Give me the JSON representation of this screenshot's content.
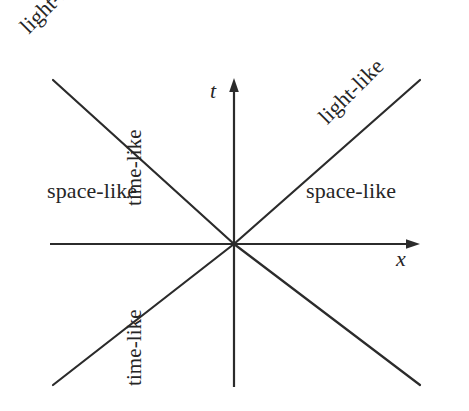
{
  "figure": {
    "kind": "minkowski-light-cone-diagram",
    "background_color": "#ffffff",
    "ink_color": "#262626"
  },
  "axes": {
    "vertical": {
      "name": "t",
      "arrow": "arrow-up",
      "x": 234,
      "y_top": 78,
      "y_bottom": 387
    },
    "horizontal": {
      "name": "x",
      "arrow": "arrow-right",
      "y": 244,
      "x_left": 50,
      "x_right": 420
    },
    "origin": {
      "x": 234,
      "y": 244
    }
  },
  "lightcone": {
    "lines": [
      {
        "name": "upper-left-null-ray",
        "x1": 234,
        "y1": 244,
        "x2": 53,
        "y2": 80
      },
      {
        "name": "upper-right-null-ray",
        "x1": 234,
        "y1": 244,
        "x2": 420,
        "y2": 80
      },
      {
        "name": "lower-left-null-ray",
        "x1": 234,
        "y1": 244,
        "x2": 53,
        "y2": 385
      },
      {
        "name": "lower-right-null-ray",
        "x1": 234,
        "y1": 244,
        "x2": 420,
        "y2": 385
      }
    ]
  },
  "labels": {
    "light_like_top_left": "light-like",
    "light_like_top_right": "light-like",
    "space_like_left": "space-like",
    "space_like_right": "space-like",
    "time_like_upper": "time-like",
    "time_like_lower": "time-like",
    "axis_t": "t",
    "axis_x": "x"
  }
}
